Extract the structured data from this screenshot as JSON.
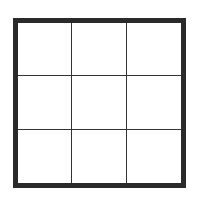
{
  "diagram": {
    "type": "grid",
    "rows": 3,
    "columns": 3,
    "cells": [
      [
        "",
        "",
        ""
      ],
      [
        "",
        "",
        ""
      ],
      [
        "",
        "",
        ""
      ]
    ],
    "colors": {
      "outer_border": "#2a2a2a",
      "inner_lines": "#333333",
      "background": "#ffffff"
    }
  }
}
